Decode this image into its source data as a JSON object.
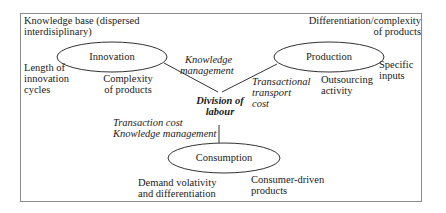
{
  "diagram": {
    "center": "Division of labour",
    "center_lines": [
      "Division of",
      "labour"
    ],
    "nodes": [
      {
        "id": "innovation",
        "label": "Innovation"
      },
      {
        "id": "production",
        "label": "Production"
      },
      {
        "id": "consumption",
        "label": "Consumption"
      }
    ],
    "corner_labels": {
      "top_left": [
        "Knowledge base (dispersed",
        "interdisiplinary)"
      ],
      "top_right": [
        "Differentiation/complexity",
        "of products"
      ]
    },
    "node_annotations": {
      "innovation_left": [
        "Length of",
        "innovation",
        "cycles"
      ],
      "innovation_below": [
        "Complexity",
        "of products"
      ],
      "production_right": [
        "Specific",
        "inputs"
      ],
      "production_below": [
        "Outsourcing",
        "activity"
      ],
      "consumption_left": [
        "Demand volativity",
        "and differentiation"
      ],
      "consumption_right": [
        "Consumer-driven",
        "products"
      ]
    },
    "edge_labels": {
      "innovation_edge": [
        "Knowledge",
        "management"
      ],
      "production_edge": [
        "Transactional",
        "transport",
        "cost"
      ],
      "consumption_edge": [
        "Transaction cost",
        "Knowledge management"
      ]
    },
    "colors": {
      "line": "#333333",
      "frame": "#8a8a8a",
      "text": "#1a1a1a"
    }
  }
}
